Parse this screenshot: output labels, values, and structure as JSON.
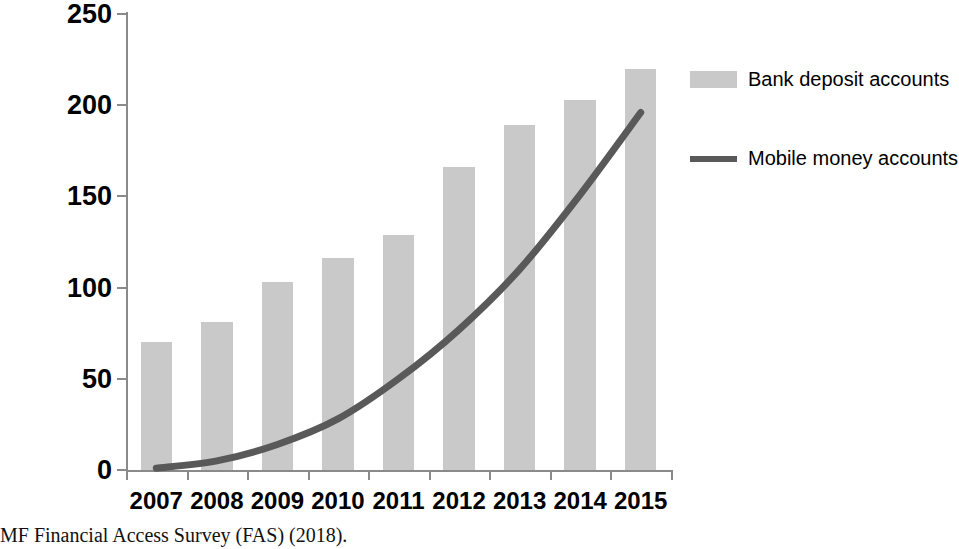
{
  "caption": {
    "text": "MF Financial Access Survey (FAS) (2018)."
  },
  "legend": {
    "position": "right",
    "items": [
      {
        "label": "Bank deposit accounts",
        "marker": "bar-swatch",
        "color": "#c9c9c9"
      },
      {
        "label": "Mobile money accounts",
        "marker": "line-swatch",
        "color": "#595959"
      }
    ]
  },
  "axis": {
    "y_ticks": [
      "250",
      "200",
      "150",
      "100",
      "50",
      "0"
    ],
    "x_ticks": [
      "2007",
      "2008",
      "2009",
      "2010",
      "2011",
      "2012",
      "2013",
      "2014",
      "2015"
    ]
  },
  "chart_data": {
    "type": "bar",
    "title": "",
    "subtitle": "",
    "xlabel": "",
    "ylabel": "",
    "categories": [
      "2007",
      "2008",
      "2009",
      "2010",
      "2011",
      "2012",
      "2013",
      "2014",
      "2015"
    ],
    "ylim": [
      0,
      250
    ],
    "ytick_step": 50,
    "grid": false,
    "legend_position": "right",
    "series": [
      {
        "name": "Bank deposit accounts",
        "type": "bar",
        "color": "#c9c9c9",
        "values": [
          70,
          81,
          103,
          116,
          129,
          166,
          189,
          203,
          220
        ]
      },
      {
        "name": "Mobile money accounts",
        "type": "line",
        "color": "#595959",
        "values": [
          1,
          5,
          14,
          28,
          50,
          77,
          110,
          151,
          196
        ]
      }
    ]
  },
  "bleed_text": "unknown reverse-side body text ghosting through the page"
}
